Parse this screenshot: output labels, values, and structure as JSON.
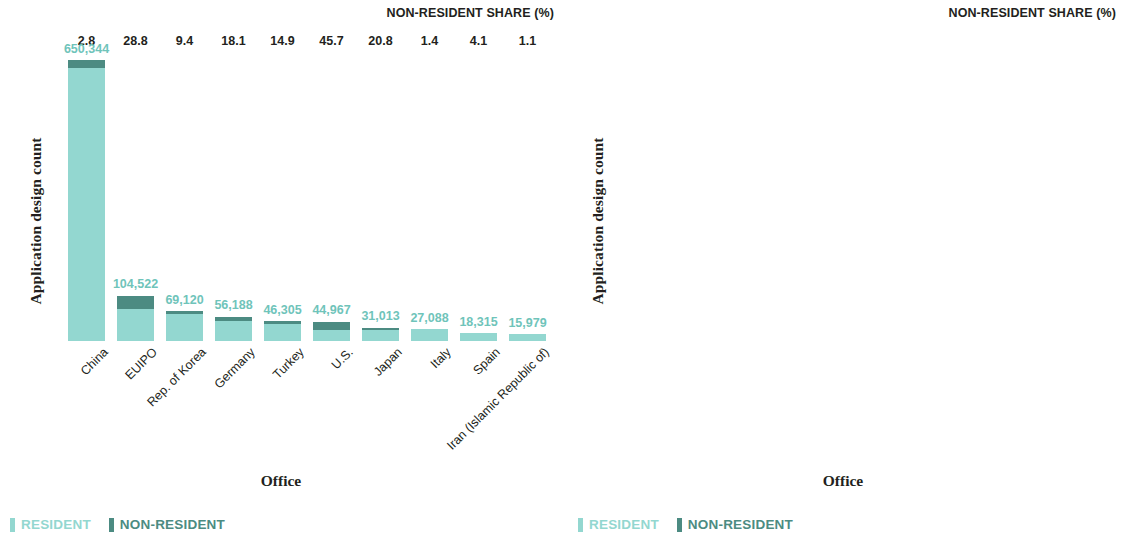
{
  "chart_data": [
    {
      "type": "bar",
      "subtype": "stacked-bar",
      "title": "",
      "xlabel": "Office",
      "ylabel": "Application design count",
      "share_header": "NON-RESIDENT SHARE (%)",
      "ylim": [
        0,
        650344
      ],
      "grid": false,
      "legend_position": "bottom-left",
      "categories": [
        "China",
        "EUIPO",
        "Rep. of Korea",
        "Germany",
        "Turkey",
        "U.S.",
        "Japan",
        "Italy",
        "Spain",
        "Iran (Islamic Republic of)"
      ],
      "totals": [
        650344,
        104522,
        69120,
        56188,
        46305,
        44967,
        31013,
        27088,
        18315,
        15979
      ],
      "total_labels": [
        "650,344",
        "104,522",
        "69,120",
        "56,188",
        "46,305",
        "44,967",
        "31,013",
        "27,088",
        "18,315",
        "15,979"
      ],
      "nonresident_share_pct": [
        2.8,
        28.8,
        9.4,
        18.1,
        14.9,
        45.7,
        20.8,
        1.4,
        4.1,
        1.1
      ],
      "nonresident_share_labels": [
        "2.8",
        "28.8",
        "9.4",
        "18.1",
        "14.9",
        "45.7",
        "20.8",
        "1.4",
        "4.1",
        "1.1"
      ],
      "series": [
        {
          "name": "RESIDENT",
          "color": "#93d7d0",
          "values": [
            632134,
            74420,
            62623,
            46018,
            39405,
            24417,
            24562,
            26709,
            17564,
            15803
          ]
        },
        {
          "name": "NON-RESIDENT",
          "color": "#4c8b82",
          "values": [
            18210,
            30102,
            6497,
            10170,
            6900,
            20550,
            6451,
            379,
            751,
            176
          ]
        }
      ]
    },
    {
      "type": "bar",
      "subtype": "stacked-bar",
      "title": "",
      "xlabel": "Office",
      "ylabel": "Application design count",
      "share_header": "NON-RESIDENT SHARE (%)",
      "ylim": [
        0,
        14751
      ],
      "grid": false,
      "legend_position": "bottom-left",
      "categories": [
        "France",
        "Switzerland",
        "India",
        "U.K.",
        "Ukraine",
        "Australia",
        "Russian Federation",
        "Canada",
        "Morocco",
        "Brazil"
      ],
      "totals": [
        14751,
        11125,
        10673,
        10030,
        8793,
        7278,
        6565,
        6170,
        6143,
        6027
      ],
      "total_labels": [
        "14,751",
        "11,125",
        "10,673",
        "10,030",
        "8,793",
        "7,278",
        "6,565",
        "6,170",
        "6,143",
        "6,027"
      ],
      "nonresident_share_pct": [
        7.3,
        65.6,
        36.7,
        12.9,
        38.7,
        62.4,
        55.6,
        85.2,
        34.0,
        43.6
      ],
      "nonresident_share_labels": [
        "7.3",
        "65.6",
        "36.7",
        "12.9",
        "38.7",
        "62.4",
        "55.6",
        "85.2",
        "34.0",
        "43.6"
      ],
      "series": [
        {
          "name": "RESIDENT",
          "color": "#93d7d0",
          "values": [
            13674,
            3827,
            6756,
            8736,
            5390,
            2737,
            2915,
            913,
            4054,
            3399
          ]
        },
        {
          "name": "NON-RESIDENT",
          "color": "#4c8b82",
          "values": [
            1077,
            7298,
            3917,
            1294,
            3403,
            4541,
            3650,
            5257,
            2089,
            2628
          ]
        }
      ]
    }
  ],
  "legend": {
    "resident_label": "RESIDENT",
    "nonresident_label": "NON-RESIDENT",
    "resident_color": "#93d7d0",
    "nonresident_color": "#4c8b82"
  },
  "colors": {
    "resident": "#93d7d0",
    "nonresident": "#4c8b82",
    "value_label": "#6fc4ba",
    "text": "#231f20"
  }
}
